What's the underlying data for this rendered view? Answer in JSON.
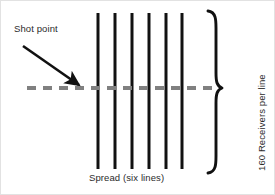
{
  "figure": {
    "background_color": "#ffffff",
    "width": 275,
    "height": 195
  },
  "labels": {
    "shot_point": "Shot point",
    "spread_caption": "Spread (six lines)",
    "receivers_per_line": "160 Receivers per line"
  },
  "colors": {
    "line_black": "#111111",
    "dashed_gray": "#808080",
    "text": "#2b2b2b",
    "brace": "#111111",
    "arrow": "#111111"
  },
  "chart_data": {
    "type": "diagram",
    "title": "Spread (six lines)",
    "receiver_lines": {
      "count": 6,
      "label": "Spread (six lines)",
      "receivers_per_line": 160,
      "orientation": "vertical",
      "color": "#111111",
      "stroke_width": 3,
      "x_positions": [
        97,
        114,
        131,
        148,
        165,
        181
      ],
      "y_top": 12,
      "y_bottom": 168
    },
    "shot_line": {
      "label": "shot line",
      "orientation": "horizontal",
      "style": "dashed",
      "color": "#808080",
      "stroke_width": 4,
      "dash_pattern": [
        9,
        7
      ],
      "y": 87,
      "x_start": 26,
      "x_end": 218
    },
    "shot_point_arrow": {
      "label": "Shot point",
      "from": [
        22,
        45
      ],
      "to": [
        80,
        86
      ],
      "color": "#111111"
    },
    "brace": {
      "label": "160 Receivers per line",
      "side": "right",
      "x": 207,
      "tip_x": 221,
      "y_top": 10,
      "y_bottom": 172,
      "y_tip": 87,
      "color": "#111111"
    }
  }
}
